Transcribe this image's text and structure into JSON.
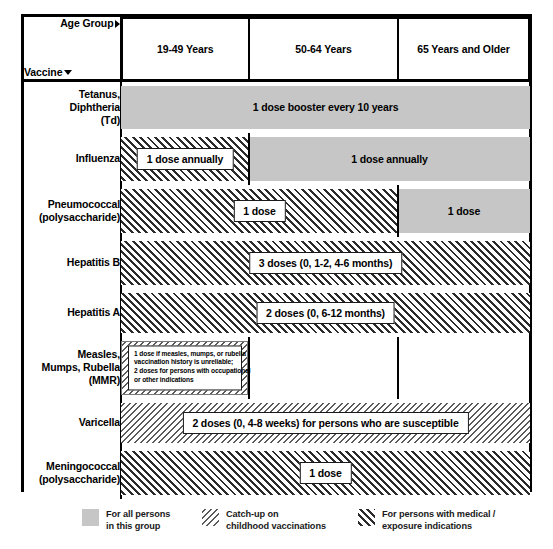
{
  "header": {
    "age_group_label": "Age Group",
    "vaccine_label": "Vaccine",
    "columns": [
      {
        "id": "19-49",
        "label": "19-49 Years"
      },
      {
        "id": "50-64",
        "label": "50-64 Years"
      },
      {
        "id": "65plus",
        "label": "65 Years and Older"
      }
    ]
  },
  "rows": [
    {
      "vaccine": "Tetanus,\nDiphtheria\n(Td)",
      "text": "1 dose booster every 10 years"
    },
    {
      "vaccine": "Influenza",
      "text_19_49": "1 dose annually",
      "text_50_plus": "1 dose annually"
    },
    {
      "vaccine": "Pneumococcal\n(polysaccharide)",
      "text_19_64": "1 dose",
      "text_65": "1 dose"
    },
    {
      "vaccine": "Hepatitis B",
      "text": "3 doses (0, 1-2, 4-6 months)"
    },
    {
      "vaccine": "Hepatitis A",
      "text": "2 doses (0, 6-12 months)"
    },
    {
      "vaccine": "Measles,\nMumps, Rubella\n(MMR)",
      "note_line1": "1 dose if measles, mumps, or rubella",
      "note_line2": "vaccination history is unreliable;",
      "note_line3": "2 doses for persons with occupational",
      "note_line4": "or other indications"
    },
    {
      "vaccine": "Varicella",
      "text": "2 doses (0, 4-8 weeks) for persons who are susceptible"
    },
    {
      "vaccine": "Meningococcal\n(polysaccharide)",
      "text": "1 dose"
    }
  ],
  "legend": [
    {
      "id": "all-persons",
      "label": "For all persons\nin this group",
      "pattern": "solid",
      "color": "#c6c6c6"
    },
    {
      "id": "catch-up",
      "label": "Catch-up on\nchildhood vaccinations",
      "pattern": "backslash-hatch",
      "color": "#5a5a5a"
    },
    {
      "id": "medical",
      "label": "For persons with medical /\nexposure indications",
      "pattern": "forwardslash-hatch",
      "color": "#2b2b2b"
    }
  ]
}
